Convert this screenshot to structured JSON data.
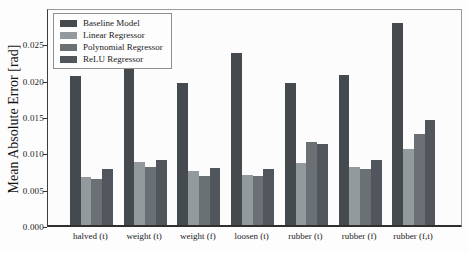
{
  "chart_data": {
    "type": "bar",
    "title": "",
    "xlabel": "",
    "ylabel": "Mean Absolute Error [rad]",
    "ylim": [
      0,
      0.03
    ],
    "grid": false,
    "legend_position": "upper left",
    "yticks": [
      0,
      0.005,
      0.01,
      0.015,
      0.02,
      0.025
    ],
    "ytick_labels": [
      "0.000",
      "0.005",
      "0.010",
      "0.015",
      "0.020",
      "0.025"
    ],
    "categories": [
      "halved (t)",
      "weight (t)",
      "weight (f)",
      "loosen (t)",
      "rubber (t)",
      "rubber (f)",
      "rubber (f,t)"
    ],
    "series": [
      {
        "name": "Baseline Model",
        "color": "#454a4e",
        "values": [
          0.0205,
          0.0221,
          0.0196,
          0.0237,
          0.0196,
          0.0207,
          0.0278
        ]
      },
      {
        "name": "Linear Regressor",
        "color": "#939a9d",
        "values": [
          0.0066,
          0.0087,
          0.0074,
          0.0069,
          0.0086,
          0.008,
          0.0105
        ]
      },
      {
        "name": "Polynomial Regressor",
        "color": "#6a7074",
        "values": [
          0.0064,
          0.008,
          0.0068,
          0.0068,
          0.0114,
          0.0077,
          0.0125
        ]
      },
      {
        "name": "ReLU Regressor",
        "color": "#50565b",
        "values": [
          0.0077,
          0.009,
          0.0079,
          0.0077,
          0.0112,
          0.009,
          0.0145
        ]
      }
    ],
    "colors": {
      "plot_background": "#fcfcfc",
      "figure_background": "#fdfdfd",
      "spine_dark": "#2f2f2f",
      "spine_light": "#9a9a9a",
      "text": "#1b1b1b"
    }
  }
}
